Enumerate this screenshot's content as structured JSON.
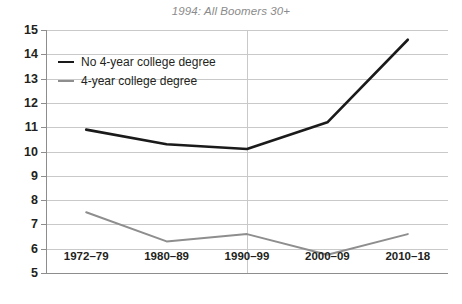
{
  "chart_data": {
    "type": "line",
    "title": "1994: All Boomers 30+",
    "xlabel": "",
    "ylabel": "",
    "categories": [
      "1972–79",
      "1980–89",
      "1990–99",
      "2000–09",
      "2010–18"
    ],
    "ylim": [
      5,
      15
    ],
    "yticks": [
      5,
      6,
      7,
      8,
      9,
      10,
      11,
      12,
      13,
      14,
      15
    ],
    "ytick_labels": [
      "5",
      "6",
      "7",
      "8",
      "9",
      "10",
      "11",
      "12",
      "13",
      "14",
      "15"
    ],
    "grid": "horizontal gridlines at every integer tick; vertical gridline at 1990–99 and at left axis",
    "legend_position": "upper-left inside plot",
    "series": [
      {
        "name": "No 4-year college degree",
        "color": "#1a1a1a",
        "values": [
          10.9,
          10.3,
          10.1,
          11.2,
          14.6
        ]
      },
      {
        "name": "4-year college degree",
        "color": "#8e8e8e",
        "values": [
          7.5,
          6.3,
          6.6,
          5.75,
          6.6
        ]
      }
    ]
  },
  "legend": {
    "items": [
      {
        "label": "No 4-year college degree",
        "swatch": "dark"
      },
      {
        "label": "4-year college degree",
        "swatch": "gray"
      }
    ]
  },
  "colors": {
    "series_dark": "#1a1a1a",
    "series_gray": "#8e8e8e",
    "gridline": "#c9c9c9",
    "axis": "#8d8d8d",
    "title_text": "#8b8b8b",
    "tick_text": "#231f20",
    "background": "#ffffff"
  }
}
